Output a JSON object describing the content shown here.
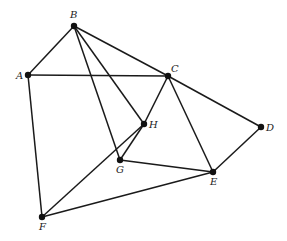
{
  "graph": {
    "nodes": [
      {
        "id": "A",
        "x": 28,
        "y": 75,
        "lx": 16,
        "ly": 79
      },
      {
        "id": "B",
        "x": 74,
        "y": 26,
        "lx": 70,
        "ly": 18
      },
      {
        "id": "C",
        "x": 168,
        "y": 76,
        "lx": 171,
        "ly": 72
      },
      {
        "id": "D",
        "x": 261,
        "y": 127,
        "lx": 266,
        "ly": 131
      },
      {
        "id": "E",
        "x": 213,
        "y": 172,
        "lx": 210,
        "ly": 185
      },
      {
        "id": "F",
        "x": 42,
        "y": 217,
        "lx": 39,
        "ly": 230
      },
      {
        "id": "G",
        "x": 120,
        "y": 160,
        "lx": 116,
        "ly": 173
      },
      {
        "id": "H",
        "x": 144,
        "y": 124,
        "lx": 149,
        "ly": 128
      }
    ],
    "edges": [
      [
        "A",
        "B"
      ],
      [
        "A",
        "C"
      ],
      [
        "A",
        "F"
      ],
      [
        "B",
        "C"
      ],
      [
        "B",
        "H"
      ],
      [
        "B",
        "G"
      ],
      [
        "C",
        "H"
      ],
      [
        "C",
        "E"
      ],
      [
        "C",
        "D"
      ],
      [
        "D",
        "E"
      ],
      [
        "G",
        "H"
      ],
      [
        "G",
        "E"
      ],
      [
        "F",
        "H"
      ],
      [
        "F",
        "E"
      ]
    ]
  }
}
